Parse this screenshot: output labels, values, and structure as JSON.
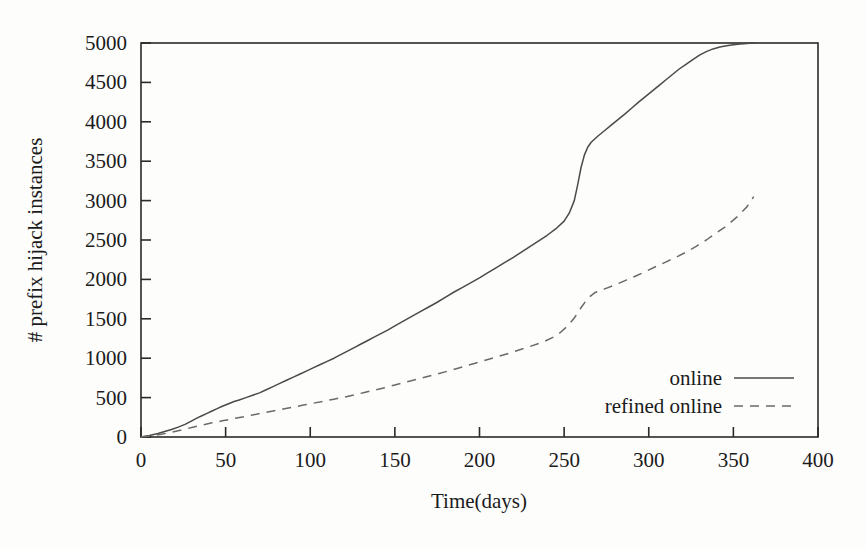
{
  "chart_data": {
    "type": "line",
    "title": "",
    "xlabel": "Time(days)",
    "ylabel": "# prefix hijack instances",
    "xlim": [
      0,
      400
    ],
    "ylim": [
      0,
      5000
    ],
    "xticks": [
      "0",
      "50",
      "100",
      "150",
      "200",
      "250",
      "300",
      "350",
      "400"
    ],
    "yticks": [
      "0",
      "500",
      "1000",
      "1500",
      "2000",
      "2500",
      "3000",
      "3500",
      "4000",
      "4500",
      "5000"
    ],
    "grid": false,
    "legend_position": "bottom-right",
    "legend_entries": [
      {
        "label": "online",
        "style": "solid",
        "color": "#4a4a4a"
      },
      {
        "label": "refined online",
        "style": "dashed",
        "color": "#6a6a6a"
      }
    ],
    "series": [
      {
        "name": "online",
        "style": "solid",
        "x": [
          0,
          5,
          10,
          14,
          18,
          22,
          26,
          30,
          33,
          36,
          39,
          42,
          45,
          48,
          51,
          55,
          58,
          62,
          66,
          70,
          74,
          78,
          82,
          86,
          90,
          94,
          98,
          102,
          106,
          110,
          114,
          118,
          122,
          126,
          130,
          134,
          138,
          142,
          146,
          150,
          155,
          160,
          165,
          170,
          175,
          180,
          185,
          190,
          195,
          200,
          205,
          210,
          215,
          220,
          225,
          230,
          235,
          240,
          245,
          250,
          253,
          256,
          258,
          260,
          262,
          264,
          266,
          270,
          274,
          278,
          282,
          286,
          290,
          294,
          298,
          302,
          306,
          310,
          314,
          318,
          322,
          326,
          330,
          334,
          338,
          342,
          346,
          350,
          354,
          358,
          361,
          363
        ],
        "y": [
          0,
          20,
          45,
          70,
          95,
          125,
          160,
          205,
          240,
          270,
          300,
          330,
          360,
          390,
          415,
          450,
          470,
          500,
          530,
          560,
          600,
          640,
          680,
          720,
          760,
          800,
          840,
          880,
          920,
          960,
          1000,
          1045,
          1090,
          1135,
          1180,
          1225,
          1270,
          1315,
          1360,
          1410,
          1470,
          1530,
          1590,
          1650,
          1710,
          1775,
          1840,
          1900,
          1960,
          2020,
          2085,
          2150,
          2215,
          2280,
          2350,
          2420,
          2490,
          2560,
          2640,
          2740,
          2840,
          3000,
          3200,
          3420,
          3580,
          3680,
          3740,
          3820,
          3890,
          3960,
          4030,
          4100,
          4175,
          4250,
          4320,
          4390,
          4460,
          4530,
          4600,
          4670,
          4730,
          4790,
          4845,
          4890,
          4925,
          4950,
          4965,
          4978,
          4988,
          4995,
          5000,
          5000
        ]
      },
      {
        "name": "refined online",
        "style": "dashed",
        "x": [
          0,
          6,
          12,
          18,
          24,
          30,
          36,
          42,
          48,
          54,
          60,
          66,
          72,
          78,
          84,
          90,
          96,
          102,
          108,
          114,
          120,
          126,
          132,
          138,
          144,
          150,
          158,
          166,
          174,
          182,
          190,
          198,
          206,
          214,
          222,
          230,
          238,
          244,
          248,
          252,
          256,
          260,
          264,
          268,
          274,
          280,
          286,
          292,
          298,
          304,
          310,
          316,
          322,
          328,
          334,
          340,
          346,
          352,
          358,
          362
        ],
        "y": [
          0,
          15,
          35,
          60,
          90,
          120,
          150,
          180,
          205,
          230,
          255,
          280,
          305,
          330,
          355,
          380,
          405,
          430,
          455,
          480,
          505,
          535,
          565,
          595,
          625,
          660,
          705,
          750,
          795,
          840,
          890,
          940,
          990,
          1040,
          1095,
          1150,
          1210,
          1270,
          1330,
          1410,
          1510,
          1640,
          1760,
          1830,
          1880,
          1930,
          1985,
          2040,
          2100,
          2160,
          2220,
          2280,
          2345,
          2420,
          2500,
          2590,
          2680,
          2790,
          2920,
          3050
        ]
      }
    ]
  },
  "axis": {
    "x_title": "Time(days)",
    "y_title": "# prefix hijack instances"
  }
}
